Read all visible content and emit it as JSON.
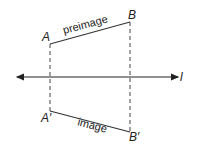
{
  "diagram": {
    "points": {
      "A": "A",
      "B": "B",
      "A_prime": "A′",
      "B_prime": "B′"
    },
    "line_label": "l",
    "preimage_label": "preimage",
    "image_label": "image"
  }
}
